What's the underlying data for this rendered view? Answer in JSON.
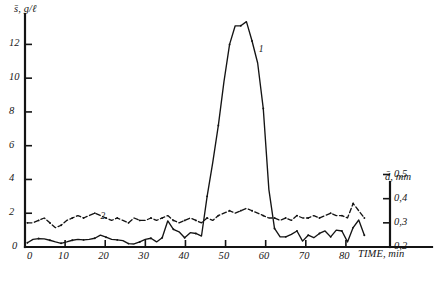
{
  "figure": {
    "name": "sediment-concentration-and-grain-size-vs-time",
    "caption": ""
  },
  "chart_data": {
    "type": "line",
    "title": "",
    "subtitle": "",
    "xlabel": "TIME, min",
    "ylabel": "s̄, g/ℓ",
    "y2label": "d̄, mm",
    "xlim": [
      0,
      88
    ],
    "ylim": [
      0,
      13.8
    ],
    "y2lim": [
      0.2,
      0.56
    ],
    "grid": false,
    "legend_position": "inline-annotation",
    "xticks": [
      0,
      10,
      20,
      30,
      40,
      50,
      60,
      70,
      80
    ],
    "xticklabels": [
      "0",
      "10",
      "20",
      "30",
      "40",
      "50",
      "60",
      "70",
      "80"
    ],
    "yticks": [
      0,
      2,
      4,
      6,
      8,
      10,
      12
    ],
    "yticklabels": [
      "0",
      "2",
      "4",
      "6",
      "8",
      "10",
      "12"
    ],
    "y2ticks": [
      0.2,
      0.3,
      0.4,
      0.5
    ],
    "y2ticklabels": [
      "0,2",
      "0,3",
      "0,4",
      "0,5"
    ],
    "annotations": [
      {
        "text": "1",
        "x": 59.0,
        "y": 11.6,
        "note": "curve label for solid sediment concentration line"
      },
      {
        "text": "2",
        "x": 19.6,
        "y": 1.72,
        "note": "curve label for dashed mean grain size line"
      }
    ],
    "series": [
      {
        "name": "1",
        "label": "s̄, g/ℓ (mean sediment concentration)",
        "style": "solid",
        "axis": "left",
        "marker": "dot",
        "x": [
          0.6,
          2.0,
          3.4,
          4.8,
          6.2,
          7.6,
          9.0,
          10.4,
          11.8,
          13.2,
          14.6,
          16.0,
          17.4,
          18.8,
          20.2,
          21.6,
          23.0,
          24.4,
          25.8,
          27.2,
          28.6,
          30.0,
          31.4,
          32.8,
          34.2,
          35.6,
          37.0,
          38.4,
          39.8,
          41.2,
          42.6,
          44.0,
          45.4,
          46.8,
          48.2,
          49.6,
          51.0,
          52.4,
          53.8,
          55.2,
          56.6,
          58.0,
          59.4,
          60.8,
          62.2,
          63.6,
          65.0,
          66.4,
          67.8,
          69.2,
          70.6,
          72.0,
          73.4,
          74.8,
          76.2,
          77.6,
          79.0,
          80.4,
          81.8,
          83.2,
          84.6
        ],
        "y": [
          0.25,
          0.45,
          0.5,
          0.48,
          0.4,
          0.3,
          0.22,
          0.3,
          0.4,
          0.45,
          0.42,
          0.45,
          0.52,
          0.7,
          0.58,
          0.45,
          0.42,
          0.38,
          0.2,
          0.18,
          0.3,
          0.45,
          0.52,
          0.3,
          0.55,
          1.55,
          1.05,
          0.9,
          0.55,
          0.85,
          0.8,
          0.65,
          3.0,
          5.0,
          7.2,
          9.8,
          12.0,
          13.1,
          13.1,
          13.35,
          12.2,
          10.9,
          8.2,
          3.4,
          1.1,
          0.6,
          0.6,
          0.75,
          0.95,
          0.35,
          0.7,
          0.55,
          0.8,
          0.95,
          0.6,
          1.0,
          0.95,
          0.3,
          1.15,
          1.6,
          0.7
        ]
      },
      {
        "name": "2",
        "label": "d̄, mm (mean grain size)",
        "style": "dashed",
        "axis": "right",
        "marker": "dot",
        "x": [
          0.6,
          2.0,
          3.4,
          4.8,
          6.2,
          7.6,
          9.0,
          10.4,
          11.8,
          13.2,
          14.6,
          16.0,
          17.4,
          18.8,
          20.2,
          21.6,
          23.0,
          24.4,
          25.8,
          27.2,
          28.6,
          30.0,
          31.4,
          32.8,
          34.2,
          35.6,
          37.0,
          38.4,
          39.8,
          41.2,
          42.6,
          44.0,
          45.4,
          46.8,
          48.2,
          49.6,
          51.0,
          52.4,
          53.8,
          55.2,
          56.6,
          58.0,
          59.4,
          60.8,
          62.2,
          63.6,
          65.0,
          66.4,
          67.8,
          69.2,
          70.6,
          72.0,
          73.4,
          74.8,
          76.2,
          77.6,
          79.0,
          80.4,
          81.8,
          83.2,
          84.6
        ],
        "y": [
          0.3,
          0.3,
          0.31,
          0.32,
          0.3,
          0.28,
          0.29,
          0.31,
          0.32,
          0.33,
          0.32,
          0.33,
          0.34,
          0.33,
          0.32,
          0.31,
          0.32,
          0.31,
          0.3,
          0.32,
          0.31,
          0.31,
          0.32,
          0.31,
          0.32,
          0.33,
          0.31,
          0.3,
          0.31,
          0.32,
          0.31,
          0.3,
          0.32,
          0.31,
          0.33,
          0.34,
          0.35,
          0.34,
          0.35,
          0.36,
          0.35,
          0.34,
          0.33,
          0.32,
          0.32,
          0.31,
          0.32,
          0.31,
          0.33,
          0.32,
          0.32,
          0.33,
          0.32,
          0.33,
          0.34,
          0.33,
          0.33,
          0.32,
          0.38,
          0.35,
          0.32
        ]
      }
    ]
  }
}
